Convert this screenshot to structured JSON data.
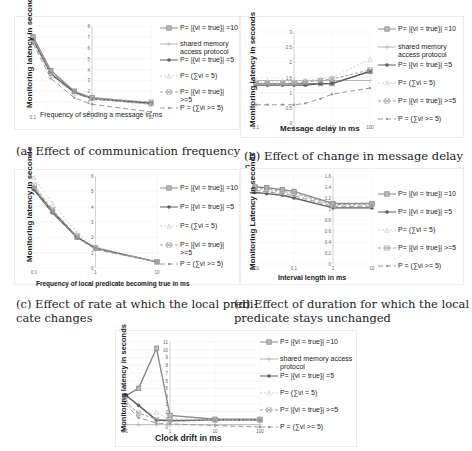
{
  "captions": {
    "a": "(a) Effect of communication frequency",
    "b": "(b) Effect of change in message delay δ",
    "c_line1": "(c) Effect of rate at which the local predi-",
    "c_line2": "cate changes",
    "d_line1": "(d) Effect of duration for which the local",
    "d_line2": "predicate stays unchanged"
  },
  "legend_labels": {
    "eq10": "P= |{vi = true}| =10",
    "shared": "shared memory access protocol",
    "eq5": "P= |{vi = true}| =5",
    "sum5": "P= (∑vi = 5)",
    "ge5": "P= |{vi = true}| >=5",
    "sumge5": "P = (∑vi >= 5)"
  },
  "colors": {
    "eq10": "#8a8a8a",
    "shared": "#b5b5b5",
    "eq5": "#5e5e5e",
    "sum5": "#cfcfcf",
    "ge5": "#a0a0a0",
    "sumge5": "#9a9a9a",
    "grid": "#ececec",
    "axis": "#bdbdbd"
  },
  "chart_data": [
    {
      "id": "a",
      "type": "line",
      "title": "(a) Effect of communication frequency",
      "xlabel": "Frequency of sending a message in ms",
      "ylabel": "Monitoring latency in seconds",
      "xscale": "log",
      "x": [
        0.1,
        0.2,
        0.5,
        1,
        10
      ],
      "xticks": [
        "0.1",
        "1",
        "10"
      ],
      "yticks": [
        "0",
        "1",
        "2",
        "3",
        "4",
        "5",
        "6",
        "7",
        "8"
      ],
      "ylim": [
        0,
        8
      ],
      "grid": true,
      "legend_position": "right",
      "series": [
        {
          "name": "P= |{vi = true}| =10",
          "values": [
            7.0,
            3.9,
            2.0,
            1.4,
            0.9
          ]
        },
        {
          "name": "shared memory access protocol",
          "values": [
            6.8,
            3.6,
            1.9,
            1.3,
            0.8
          ]
        },
        {
          "name": "P= |{vi = true}| =5",
          "values": [
            6.7,
            3.6,
            1.9,
            1.3,
            0.9
          ]
        },
        {
          "name": "P= (∑vi = 5)",
          "values": [
            6.6,
            3.5,
            1.8,
            1.3,
            0.8
          ]
        },
        {
          "name": "P= |{vi = true}| >=5",
          "values": [
            6.9,
            3.8,
            2.0,
            1.4,
            1.0
          ]
        },
        {
          "name": "P = (∑vi >= 5)",
          "values": [
            6.4,
            3.2,
            1.4,
            0.8,
            0.1
          ]
        }
      ]
    },
    {
      "id": "b",
      "type": "line",
      "title": "(b) Effect of change in message delay δ",
      "xlabel": "Message delay in ms",
      "ylabel": "Monitoring latency in seconds",
      "xscale": "log",
      "x": [
        0.1,
        0.2,
        0.5,
        1,
        2,
        5,
        10,
        100
      ],
      "xticks": [
        "0.1",
        "1",
        "10",
        "100"
      ],
      "yticks": [
        "0",
        "0.5",
        "1",
        "1.5",
        "2",
        "2.5",
        "3"
      ],
      "ylim": [
        0,
        3
      ],
      "grid": true,
      "legend_position": "right",
      "series": [
        {
          "name": "P= |{vi = true}| =10",
          "values": [
            1.3,
            1.3,
            1.3,
            1.3,
            1.3,
            1.3,
            1.3,
            1.7
          ]
        },
        {
          "name": "shared memory access protocol",
          "values": [
            1.4,
            1.4,
            1.4,
            1.4,
            1.4,
            1.4,
            1.4,
            1.4
          ]
        },
        {
          "name": "P= |{vi = true}| =5",
          "values": [
            1.25,
            1.25,
            1.25,
            1.25,
            1.25,
            1.3,
            1.3,
            1.7
          ]
        },
        {
          "name": "P= (∑vi = 5)",
          "values": [
            1.35,
            1.35,
            1.35,
            1.35,
            1.4,
            1.45,
            1.5,
            2.1
          ]
        },
        {
          "name": "P= |{vi = true}| >=5",
          "values": [
            1.3,
            1.3,
            1.3,
            1.3,
            1.35,
            1.4,
            1.45,
            1.75
          ]
        },
        {
          "name": "P = (∑vi >= 5)",
          "values": [
            0.6,
            0.6,
            0.6,
            0.6,
            0.65,
            0.8,
            0.95,
            1.15
          ]
        }
      ]
    },
    {
      "id": "c",
      "type": "line",
      "title": "(c) Effect of rate at which the local predicate changes",
      "xlabel": "Frequency of local predicate becoming true in ms",
      "ylabel": "Monitoring latency in seconds",
      "xscale": "log",
      "x": [
        0.1,
        0.2,
        0.5,
        1,
        10
      ],
      "xticks": [
        "0.1",
        "1",
        "10"
      ],
      "yticks": [
        "0",
        "1",
        "2",
        "3",
        "4",
        "5",
        "6"
      ],
      "ylim": [
        0,
        6
      ],
      "grid": true,
      "legend_position": "right",
      "series": [
        {
          "name": "P= |{vi = true}| =10",
          "values": [
            5.2,
            3.7,
            2.0,
            1.3,
            0.4
          ]
        },
        {
          "name": "P= |{vi = true}| =5",
          "values": [
            5.1,
            3.6,
            2.0,
            1.3,
            0.4
          ]
        },
        {
          "name": "P= (∑vi = 5)",
          "values": [
            5.9,
            4.2,
            2.3,
            1.4,
            0.4
          ]
        },
        {
          "name": "P= |{vi = true}| >=5",
          "values": [
            5.4,
            3.8,
            2.1,
            1.3,
            0.4
          ]
        },
        {
          "name": "P = (∑vi >= 5)",
          "values": [
            5.2,
            3.6,
            2.0,
            1.2,
            0.4
          ]
        }
      ]
    },
    {
      "id": "d",
      "type": "line",
      "title": "(d) Effect of duration for which the local predicate stays unchanged",
      "xlabel": "Interval length in ms",
      "ylabel": "Monitoring Latency in seconds",
      "xscale": "log",
      "x": [
        0.01,
        0.02,
        0.05,
        0.1,
        1,
        10
      ],
      "xticks": [
        "0.01",
        "0.1",
        "1",
        "10"
      ],
      "yticks": [
        "0",
        "0.2",
        "0.4",
        "0.6",
        "0.8",
        "1",
        "1.2",
        "1.4",
        "1.6"
      ],
      "ylim": [
        0,
        1.6
      ],
      "grid": true,
      "legend_position": "right",
      "series": [
        {
          "name": "P= |{vi = true}| =10",
          "values": [
            1.4,
            1.39,
            1.35,
            1.32,
            1.1,
            1.1
          ]
        },
        {
          "name": "P= |{vi = true}| =5",
          "values": [
            1.3,
            1.28,
            1.25,
            1.2,
            1.02,
            1.02
          ]
        },
        {
          "name": "P= (∑vi = 5)",
          "values": [
            1.36,
            1.34,
            1.3,
            1.27,
            1.06,
            1.07
          ]
        },
        {
          "name": "P= |{vi = true}| >=5",
          "values": [
            1.38,
            1.36,
            1.32,
            1.29,
            1.08,
            1.09
          ]
        },
        {
          "name": "P = (∑vi >= 5)",
          "values": [
            1.34,
            1.31,
            1.28,
            1.24,
            1.05,
            1.05
          ]
        }
      ]
    },
    {
      "id": "e",
      "type": "line",
      "title": "",
      "xlabel": "Clock drift in ms",
      "ylabel": "Monitoring latency in seconds",
      "xscale": "log",
      "x": [
        0.1,
        0.2,
        0.5,
        1,
        10,
        100
      ],
      "xticks": [
        "0.1",
        "1",
        "10",
        "100"
      ],
      "yticks": [
        "0",
        "1",
        "2",
        "3",
        "4",
        "5",
        "6",
        "7",
        "8",
        "9",
        "10",
        "11"
      ],
      "ylim": [
        0,
        11
      ],
      "grid": true,
      "legend_position": "right",
      "series": [
        {
          "name": "P= |{vi = true}| =10",
          "values": [
            4.0,
            5.0,
            10.2,
            1.5,
            1.0,
            1.0
          ]
        },
        {
          "name": "shared memory access protocol",
          "values": [
            0.3,
            0.3,
            0.3,
            0.3,
            0.3,
            0.3
          ]
        },
        {
          "name": "P= |{vi = true}| =5",
          "values": [
            4.2,
            2.8,
            0.9,
            0.8,
            0.9,
            0.9
          ]
        },
        {
          "name": "P= (∑vi = 5)",
          "values": [
            3.5,
            1.5,
            1.9,
            1.0,
            0.9,
            0.9
          ]
        },
        {
          "name": "P= |{vi = true}| >=5",
          "values": [
            3.2,
            1.8,
            1.0,
            0.9,
            0.9,
            0.9
          ]
        },
        {
          "name": "P = (∑vi >= 5)",
          "values": [
            3.0,
            1.2,
            0.5,
            0.4,
            0.2,
            0.0
          ]
        }
      ]
    }
  ]
}
